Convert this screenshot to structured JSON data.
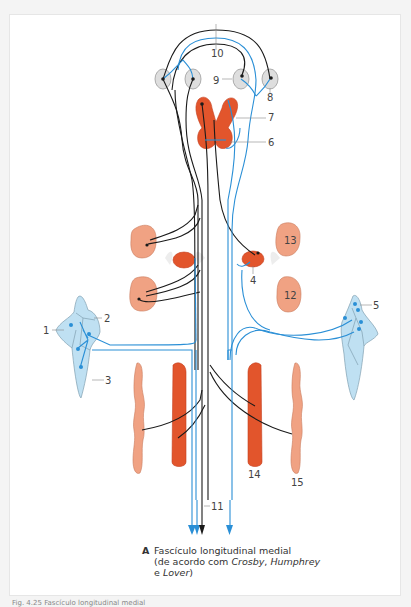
{
  "figure": {
    "panel_letter": "A",
    "caption_line1": "Fascículo longitudinal medial",
    "caption_line2_prefix": "(de acordo com ",
    "caption_author1": "Crosby",
    "caption_sep": ", ",
    "caption_author2": "Humphrey",
    "caption_line3_prefix": "e ",
    "caption_author3": "Lover",
    "caption_line3_suffix": ")",
    "footer_text": "Fig. 4.25 Fascículo longitudinal medial"
  },
  "labels": [
    {
      "id": "1",
      "text": "1"
    },
    {
      "id": "2",
      "text": "2"
    },
    {
      "id": "3",
      "text": "3"
    },
    {
      "id": "4",
      "text": "4"
    },
    {
      "id": "5",
      "text": "5"
    },
    {
      "id": "6",
      "text": "6"
    },
    {
      "id": "7",
      "text": "7"
    },
    {
      "id": "8",
      "text": "8"
    },
    {
      "id": "9",
      "text": "9"
    },
    {
      "id": "10",
      "text": "10"
    },
    {
      "id": "11",
      "text": "11"
    },
    {
      "id": "12",
      "text": "12"
    },
    {
      "id": "13",
      "text": "13"
    },
    {
      "id": "14",
      "text": "14"
    },
    {
      "id": "15",
      "text": "15"
    }
  ],
  "colors": {
    "blue_fiber": "#2a8fd6",
    "black_fiber": "#1a1a1a",
    "nucleus_dark": "#e2552c",
    "nucleus_light": "#f0a283",
    "vestibular": "#bfe0f2",
    "eye_ganglion": "#dedede"
  }
}
